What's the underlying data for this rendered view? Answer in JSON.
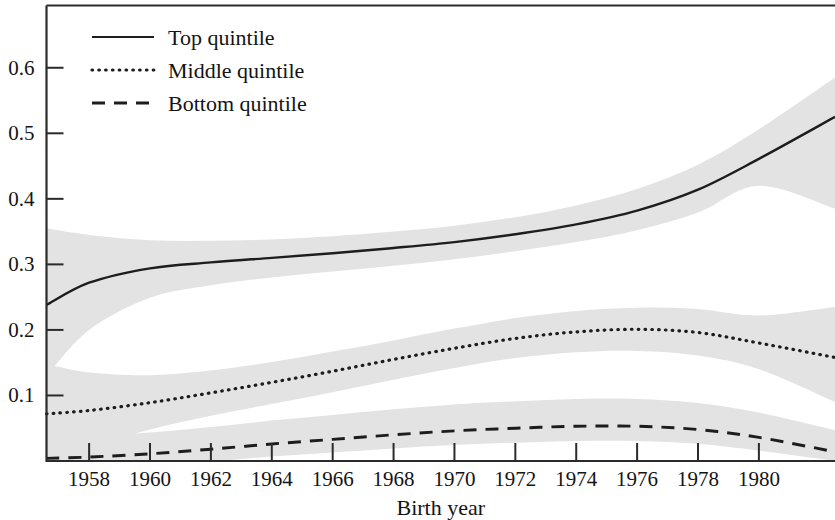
{
  "chart_data": {
    "type": "line",
    "title": "",
    "xlabel": "Birth year",
    "ylabel": "",
    "xlim": [
      1956.6,
      1982.5
    ],
    "ylim": [
      0.0,
      0.695
    ],
    "grid": false,
    "legend_position": "top-left",
    "xticks": [
      1958,
      1960,
      1962,
      1964,
      1966,
      1968,
      1970,
      1972,
      1974,
      1976,
      1978,
      1980
    ],
    "xtick_labels": [
      "1958",
      "1960",
      "1962",
      "1964",
      "1966",
      "1968",
      "1970",
      "1972",
      "1974",
      "1976",
      "1978",
      "1980"
    ],
    "yticks": [
      0.1,
      0.2,
      0.3,
      0.4,
      0.5,
      0.6
    ],
    "ytick_labels": [
      "0.1",
      "0.2",
      "0.3",
      "0.4",
      "0.5",
      "0.6"
    ],
    "band_color": "#e3e3e3",
    "line_color": "#1d1d1d",
    "x": [
      1956.6,
      1958,
      1960,
      1962,
      1964,
      1966,
      1968,
      1970,
      1972,
      1974,
      1976,
      1978,
      1980,
      1982.5
    ],
    "series": [
      {
        "name": "Top quintile",
        "style": "solid",
        "values": [
          0.238,
          0.272,
          0.294,
          0.303,
          0.31,
          0.317,
          0.325,
          0.334,
          0.346,
          0.361,
          0.382,
          0.414,
          0.461,
          0.525
        ],
        "band_upper": [
          0.355,
          0.345,
          0.337,
          0.336,
          0.338,
          0.343,
          0.35,
          0.359,
          0.372,
          0.39,
          0.415,
          0.452,
          0.506,
          0.585
        ],
        "band_lower": [
          0.13,
          0.2,
          0.249,
          0.268,
          0.28,
          0.289,
          0.298,
          0.308,
          0.32,
          0.334,
          0.352,
          0.379,
          0.42,
          0.385
        ]
      },
      {
        "name": "Middle quintile",
        "style": "dotted",
        "values": [
          0.072,
          0.077,
          0.089,
          0.104,
          0.12,
          0.137,
          0.155,
          0.172,
          0.187,
          0.197,
          0.201,
          0.196,
          0.18,
          0.158
        ],
        "band_upper": [
          0.148,
          0.135,
          0.131,
          0.138,
          0.151,
          0.167,
          0.184,
          0.202,
          0.218,
          0.229,
          0.234,
          0.232,
          0.222,
          0.235
        ],
        "band_lower": [
          0.0,
          0.02,
          0.048,
          0.069,
          0.087,
          0.105,
          0.124,
          0.142,
          0.157,
          0.166,
          0.168,
          0.161,
          0.14,
          0.09
        ]
      },
      {
        "name": "Bottom quintile",
        "style": "dashed",
        "values": [
          0.004,
          0.006,
          0.011,
          0.018,
          0.026,
          0.033,
          0.04,
          0.046,
          0.05,
          0.053,
          0.053,
          0.048,
          0.036,
          0.014
        ]
      }
    ]
  },
  "legend": {
    "entries": [
      {
        "label": "Top quintile",
        "style": "solid"
      },
      {
        "label": "Middle quintile",
        "style": "dotted"
      },
      {
        "label": "Bottom quintile",
        "style": "dashed"
      }
    ]
  },
  "axes": {
    "x_title": "Birth year"
  }
}
